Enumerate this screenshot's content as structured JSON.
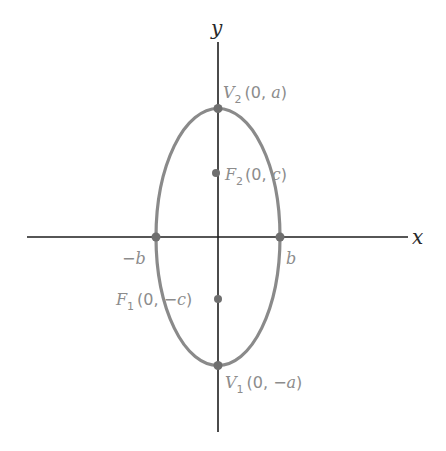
{
  "figure": {
    "axes": {
      "x_label": "x",
      "y_label": "y"
    },
    "colors": {
      "axis": "#1e1e1e",
      "curve": "#8a8a8a",
      "points": "#6f6f6f",
      "labels": "#8c8c8c"
    },
    "points": {
      "v2": {
        "name": "V",
        "sub": "2",
        "coords": "(0, a)",
        "coord_open": "(0, ",
        "coord_var": "a",
        "coord_close": ")"
      },
      "f2": {
        "name": "F",
        "sub": "2",
        "coords": "(0, c)",
        "coord_open": "(0, ",
        "coord_var": "c",
        "coord_close": ")"
      },
      "f1": {
        "name": "F",
        "sub": "1",
        "coords": "(0, −c)",
        "coord_open": "(0, −",
        "coord_var": "c",
        "coord_close": ")"
      },
      "v1": {
        "name": "V",
        "sub": "1",
        "coords": "(0, −a)",
        "coord_open": "(0, −",
        "coord_var": "a",
        "coord_close": ")"
      },
      "neg_b": {
        "label": "−b",
        "sign": "−",
        "var": "b"
      },
      "pos_b": {
        "label": "b",
        "var": "b"
      }
    }
  }
}
